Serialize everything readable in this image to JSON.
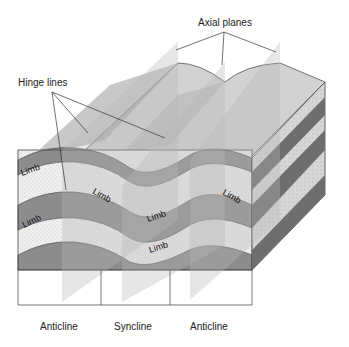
{
  "title_labels": {
    "axial_planes": "Axial planes",
    "hinge_lines": "Hinge lines"
  },
  "limb_labels": [
    "Limb",
    "Limb",
    "Limb",
    "Limb",
    "Limb",
    "Limb"
  ],
  "bottom_labels": {
    "left": "Anticline",
    "middle": "Syncline",
    "right": "Anticline"
  },
  "colors": {
    "dark_layer": "#8a8a8a",
    "light_layer": "#ececec",
    "top_surface": "#d4d4d4",
    "side_dark": "#6e6e6e",
    "side_light": "#c8c8c8",
    "axial_plane": "#b8b8b8"
  }
}
